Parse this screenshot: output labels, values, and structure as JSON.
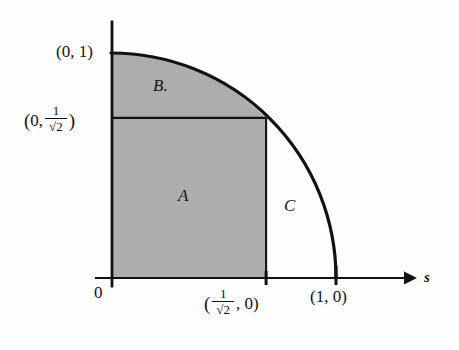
{
  "figure": {
    "background_color": "#fefefe",
    "shade_color": "#adadad",
    "line_color": "#121212"
  },
  "axes": {
    "x_axis_label": "s",
    "origin_label": "0",
    "x_axis_arrow": "arrow-right-icon",
    "y_axis_name": "y-axis",
    "ticks": [
      {
        "name": "tick-one-over-sqrt2",
        "x_fraction": 0.7071
      },
      {
        "name": "tick-one",
        "x_fraction": 1.0
      }
    ]
  },
  "curve": {
    "name": "unit-quarter-circle",
    "description": "quarter circle of radius 1 centered at origin",
    "radius": 1,
    "start_point": "(0, 1)",
    "end_point": "(1, 0)"
  },
  "regions": [
    {
      "key": "A",
      "label": "A",
      "shaded": true,
      "description": "inscribed square from origin to (1/sqrt2, 1/sqrt2)"
    },
    {
      "key": "B",
      "label": "B.",
      "shaded": true,
      "description": "region above the square, under the arc"
    },
    {
      "key": "C",
      "label": "C",
      "shaded": false,
      "description": "region right of the square, under the arc"
    }
  ],
  "labels": {
    "point_zero_one": {
      "open": "(",
      "x": "0,",
      "y": "1",
      "close": ")",
      "text": "(0, 1)"
    },
    "point_zero_inv_sqrt2": {
      "open": "(",
      "x": "0,",
      "numerator": "1",
      "denominator": "√2",
      "close": ")",
      "text": "(0, 1/√2)"
    },
    "point_inv_sqrt2_zero": {
      "open": "(",
      "numerator": "1",
      "denominator": "√2",
      "y": ", 0)",
      "text": "(1/√2, 0)"
    },
    "point_one_zero": {
      "text": "(1, 0)"
    }
  }
}
